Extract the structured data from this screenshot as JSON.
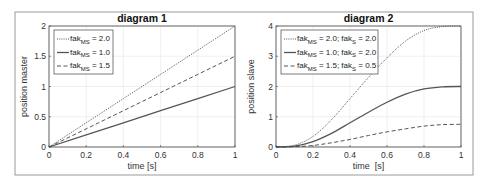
{
  "figure": {
    "frame_color": "#8a8a8a",
    "background": "#ffffff"
  },
  "chart_data": [
    {
      "type": "line",
      "title": "diagram 1",
      "xlabel": "time [s]",
      "ylabel": "position master",
      "xlim": [
        0,
        1
      ],
      "ylim": [
        0,
        2
      ],
      "xticks": [
        0,
        0.2,
        0.4,
        0.6,
        0.8,
        1
      ],
      "xtick_labels": [
        "0",
        "0.2",
        "0.4",
        "0.6",
        "0.8",
        "1"
      ],
      "yticks": [
        0,
        0.5,
        1,
        1.5,
        2
      ],
      "ytick_labels": [
        "0",
        "0.5",
        "1",
        "1.5",
        "2"
      ],
      "grid": true,
      "legend_position": "upper left",
      "x": [
        0,
        0.2,
        0.4,
        0.6,
        0.8,
        1.0
      ],
      "series": [
        {
          "name": "fak_MS = 2.0",
          "legend_main": "fak",
          "legend_sub": "MS",
          "legend_rest": " = 2.0",
          "style": "dotted",
          "color": "#555555",
          "values": [
            0,
            0.4,
            0.8,
            1.2,
            1.6,
            2.0
          ]
        },
        {
          "name": "fak_MS = 1.0",
          "legend_main": "fak",
          "legend_sub": "MS",
          "legend_rest": " = 1.0",
          "style": "solid",
          "color": "#555555",
          "values": [
            0,
            0.2,
            0.4,
            0.6,
            0.8,
            1.0
          ]
        },
        {
          "name": "fak_MS = 1.5",
          "legend_main": "fak",
          "legend_sub": "MS",
          "legend_rest": " = 1.5",
          "style": "dashed",
          "color": "#555555",
          "values": [
            0,
            0.3,
            0.6,
            0.9,
            1.2,
            1.5
          ]
        }
      ]
    },
    {
      "type": "line",
      "title": "diagram 2",
      "xlabel": "time  [s]",
      "ylabel": "position slave",
      "xlim": [
        0,
        1
      ],
      "ylim": [
        0,
        4
      ],
      "xticks": [
        0,
        0.2,
        0.4,
        0.6,
        0.8,
        1
      ],
      "xtick_labels": [
        "0",
        "0.2",
        "0.4",
        "0.6",
        "0.8",
        "1"
      ],
      "yticks": [
        0,
        1,
        2,
        3,
        4
      ],
      "ytick_labels": [
        "0",
        "1",
        "2",
        "3",
        "4"
      ],
      "grid": true,
      "legend_position": "upper left",
      "x": [
        0,
        0.1,
        0.2,
        0.3,
        0.4,
        0.5,
        0.6,
        0.7,
        0.8,
        0.9,
        1.0
      ],
      "series": [
        {
          "name": "fak_MS = 2.0; fak_S = 2.0",
          "legend_main": "fak",
          "legend_sub": "MS",
          "legend_mid": " = 2.0; fak",
          "legend_sub2": "S",
          "legend_rest": " = 2.0",
          "style": "dotted",
          "color": "#555555",
          "values": [
            0,
            0.06,
            0.35,
            0.9,
            1.6,
            2.3,
            2.95,
            3.5,
            3.85,
            3.98,
            4.0
          ]
        },
        {
          "name": "fak_MS = 1.0; fak_S = 2.0",
          "legend_main": "fak",
          "legend_sub": "MS",
          "legend_mid": " = 1.0; fak",
          "legend_sub2": "S",
          "legend_rest": " = 2.0",
          "style": "solid",
          "color": "#555555",
          "values": [
            0,
            0.03,
            0.18,
            0.45,
            0.8,
            1.15,
            1.48,
            1.75,
            1.92,
            1.99,
            2.0
          ]
        },
        {
          "name": "fak_MS = 1.5; fak_S = 0.5",
          "legend_main": "fak",
          "legend_sub": "MS",
          "legend_mid": " = 1.5; fak",
          "legend_sub2": "S",
          "legend_rest": " = 0.5",
          "style": "dashed",
          "color": "#555555",
          "values": [
            0,
            0.01,
            0.05,
            0.14,
            0.25,
            0.38,
            0.5,
            0.6,
            0.69,
            0.74,
            0.75
          ]
        }
      ]
    }
  ]
}
